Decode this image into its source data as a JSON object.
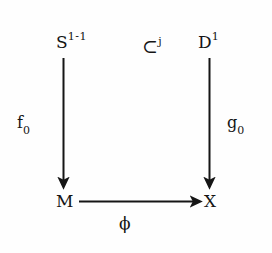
{
  "diagram": {
    "type": "commutative-square",
    "caption": "Commutative diagram of a handle attachment / pushout square",
    "background_color": "#fefefe",
    "ink_color": "#151515",
    "nodes": [
      {
        "id": "s",
        "base": "S",
        "superscript": "1-1",
        "subscript": "",
        "text": "S1-1",
        "position": "top-left"
      },
      {
        "id": "inc",
        "base": "⊂",
        "superscript": "j",
        "subscript": "",
        "text": "⊂j",
        "position": "top-middle"
      },
      {
        "id": "d",
        "base": "D",
        "superscript": "1",
        "subscript": "",
        "text": "D1",
        "position": "top-right"
      },
      {
        "id": "m",
        "base": "M",
        "superscript": "",
        "subscript": "",
        "text": "M",
        "position": "bottom-left"
      },
      {
        "id": "x",
        "base": "X",
        "superscript": "",
        "subscript": "",
        "text": "X",
        "position": "bottom-right"
      }
    ],
    "arrows": [
      {
        "id": "left-vertical",
        "from": "s",
        "to": "m",
        "direction": "down",
        "label_base": "f",
        "label_sub": "0",
        "label_text": "f0"
      },
      {
        "id": "right-vertical",
        "from": "d",
        "to": "x",
        "direction": "down",
        "label_base": "g",
        "label_sub": "0",
        "label_text": "g0"
      },
      {
        "id": "bottom-horizontal",
        "from": "m",
        "to": "x",
        "direction": "right",
        "label_base": "ϕ",
        "label_sub": "",
        "label_text": "ϕ"
      }
    ],
    "labels": {
      "top_left": "S",
      "top_left_sup": "1-1",
      "inclusion": "⊂",
      "inclusion_sup": "j",
      "top_right": "D",
      "top_right_sup": "1",
      "bottom_left": "M",
      "bottom_right": "X",
      "left_arrow": "f",
      "left_arrow_sub": "0",
      "right_arrow": "g",
      "right_arrow_sub": "0",
      "bottom_arrow": "ϕ"
    }
  }
}
